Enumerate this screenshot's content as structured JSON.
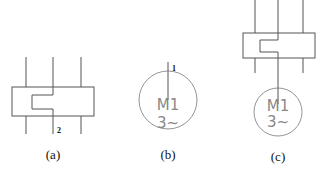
{
  "panels": [
    {
      "id": "a",
      "caption": "(a)",
      "terminal_label": "2"
    },
    {
      "id": "b",
      "caption": "(b)",
      "terminal_label": "1",
      "motor": {
        "name": "M1",
        "phase": "3~"
      }
    },
    {
      "id": "c",
      "caption": "(c)",
      "motor": {
        "name": "M1",
        "phase": "3~"
      }
    }
  ],
  "colors": {
    "line": "#555555",
    "motor_text": "#888888",
    "caption": "#111111"
  }
}
